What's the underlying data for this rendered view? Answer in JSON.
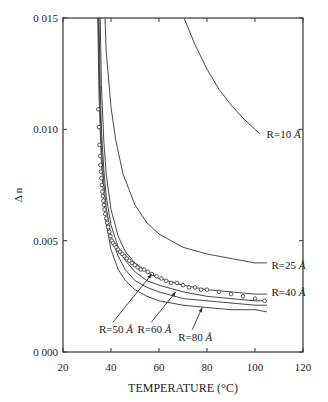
{
  "chart_data": {
    "type": "line",
    "title": "",
    "xlabel": "TEMPERATURE (°C)",
    "ylabel": "Δ n",
    "xlim": [
      20,
      120
    ],
    "ylim": [
      0.0,
      0.015
    ],
    "xticks": [
      20,
      40,
      60,
      80,
      100,
      120
    ],
    "xtick_labels": [
      "20",
      "40",
      "60",
      "80",
      "100",
      "120"
    ],
    "yticks": [
      0.0,
      0.005,
      0.01,
      0.015
    ],
    "ytick_labels": [
      "0 000",
      "0.005",
      "0.010",
      "0 015"
    ],
    "grid": false,
    "series": [
      {
        "name": "R=10 Å",
        "kind": "line",
        "x": [
          70.4,
          75,
          80,
          85,
          90,
          95,
          100,
          102
        ],
        "y": [
          0.015,
          0.0138,
          0.0127,
          0.0118,
          0.0111,
          0.0105,
          0.01,
          0.0098
        ]
      },
      {
        "name": "R=25 Å",
        "kind": "line",
        "x": [
          37.5,
          38,
          40,
          42,
          45,
          50,
          55,
          60,
          70,
          80,
          90,
          100,
          105
        ],
        "y": [
          0.015,
          0.0135,
          0.011,
          0.0095,
          0.008,
          0.0066,
          0.0058,
          0.0053,
          0.0047,
          0.0044,
          0.0042,
          0.004,
          0.004
        ]
      },
      {
        "name": "R=40 Å",
        "kind": "line",
        "x": [
          35.5,
          36,
          37,
          38,
          40,
          43,
          46,
          50,
          55,
          60,
          70,
          80,
          90,
          100,
          105
        ],
        "y": [
          0.015,
          0.012,
          0.0095,
          0.008,
          0.0064,
          0.0052,
          0.0045,
          0.004,
          0.0036,
          0.0033,
          0.003,
          0.0028,
          0.0027,
          0.0026,
          0.0026
        ]
      },
      {
        "name": "R=50 Å",
        "kind": "line",
        "x": [
          35.0,
          35.5,
          36,
          37,
          38,
          40,
          43,
          46,
          50,
          55,
          60,
          70,
          80,
          90,
          100,
          105
        ],
        "y": [
          0.015,
          0.012,
          0.01,
          0.0082,
          0.007,
          0.0057,
          0.0047,
          0.0041,
          0.0036,
          0.0032,
          0.003,
          0.0027,
          0.0025,
          0.0024,
          0.0023,
          0.0023
        ]
      },
      {
        "name": "R=60 Å",
        "kind": "line",
        "x": [
          34.7,
          35.2,
          36,
          37,
          38,
          40,
          43,
          46,
          50,
          55,
          60,
          70,
          80,
          90,
          100,
          105
        ],
        "y": [
          0.015,
          0.012,
          0.0092,
          0.0076,
          0.0065,
          0.0052,
          0.0043,
          0.0037,
          0.0032,
          0.0029,
          0.0027,
          0.0024,
          0.0023,
          0.0022,
          0.0021,
          0.0021
        ]
      },
      {
        "name": "R=80 Å",
        "kind": "line",
        "x": [
          34.5,
          35.0,
          36,
          37,
          38,
          40,
          43,
          46,
          50,
          55,
          60,
          70,
          80,
          90,
          100,
          105
        ],
        "y": [
          0.015,
          0.0115,
          0.0085,
          0.0068,
          0.0058,
          0.0046,
          0.0037,
          0.0032,
          0.0028,
          0.0025,
          0.0023,
          0.0021,
          0.002,
          0.0019,
          0.0019,
          0.0018
        ]
      },
      {
        "name": "Experimental",
        "kind": "scatter",
        "marker": "open-circle",
        "x": [
          34.7,
          35.0,
          35.2,
          35.4,
          35.6,
          35.8,
          36.0,
          36.2,
          36.4,
          36.6,
          36.8,
          37.0,
          37.3,
          37.6,
          38.0,
          38.4,
          38.8,
          39.3,
          39.8,
          40.3,
          40.9,
          41.5,
          42.2,
          43.0,
          43.8,
          44.7,
          45.6,
          46.6,
          47.6,
          48.7,
          49.9,
          51.1,
          52.4,
          53.8,
          55.3,
          57.0,
          59.0,
          61.0,
          63.0,
          65.0,
          67.5,
          70.0,
          72.5,
          75.0,
          77.5,
          80.0,
          85.0,
          90.0,
          95.0,
          100.0,
          104.0
        ],
        "y": [
          0.0109,
          0.0101,
          0.0093,
          0.0088,
          0.0084,
          0.0081,
          0.0078,
          0.0075,
          0.0072,
          0.007,
          0.0068,
          0.0066,
          0.0064,
          0.0062,
          0.006,
          0.0058,
          0.0056,
          0.0054,
          0.0052,
          0.005,
          0.0049,
          0.0048,
          0.0047,
          0.0046,
          0.0045,
          0.0044,
          0.0043,
          0.0042,
          0.0041,
          0.004,
          0.0039,
          0.0038,
          0.0037,
          0.0037,
          0.0036,
          0.0035,
          0.0034,
          0.0033,
          0.0032,
          0.0031,
          0.0031,
          0.003,
          0.0029,
          0.0029,
          0.0028,
          0.0028,
          0.0027,
          0.0026,
          0.0025,
          0.0024,
          0.0023
        ]
      }
    ],
    "annotations": [
      {
        "text": "R=10 Å",
        "x": 104,
        "y": 0.0098,
        "arrow": false
      },
      {
        "text": "R=25 Å",
        "x": 106,
        "y": 0.0039,
        "arrow": false
      },
      {
        "text": "R=40 Å",
        "x": 106,
        "y": 0.0027,
        "arrow": false
      },
      {
        "text": "R=50 Å",
        "text_x": 35,
        "text_y": 0.00085,
        "arrow_to": [
          57.0,
          0.0035
        ]
      },
      {
        "text": "R=60 Å",
        "text_x": 51,
        "text_y": 0.00085,
        "arrow_to": [
          67.0,
          0.0027
        ]
      },
      {
        "text": "R=80 Å",
        "text_x": 68,
        "text_y": 0.0005,
        "arrow_to": [
          78.0,
          0.002
        ]
      }
    ],
    "legend": "none (curves labeled inline)"
  },
  "labels": {
    "xlabel": "TEMPERATURE (°C)",
    "ylabel": "Δ n",
    "r10": "R=10",
    "r25": "R=25",
    "r40": "R=40",
    "r50": "R=50",
    "r60": "R=60",
    "r80": "R=80",
    "angstrom": "Å"
  }
}
